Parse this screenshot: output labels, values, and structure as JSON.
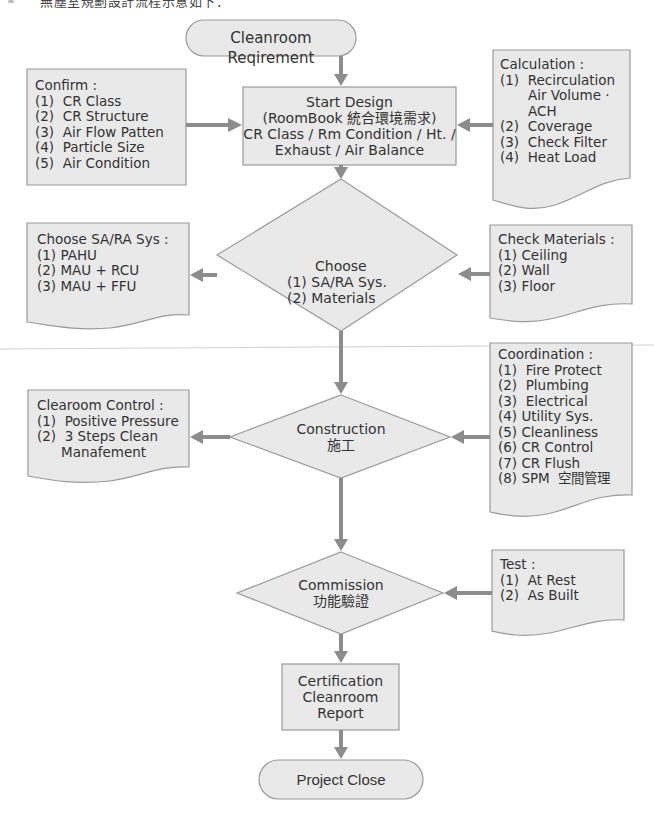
{
  "header": {
    "truncated_caption": "無塵室規劃設計流程示意如下："
  },
  "colors": {
    "shape_fill": "#e9e9e9",
    "shape_stroke": "#9a9a9a",
    "arrow": "#8c8c8c",
    "text": "#333333"
  },
  "nodes": {
    "start": {
      "label": "Cleanroom Reqirement"
    },
    "start_design": {
      "lines": [
        "Start Design",
        "(RoomBook 統合環境需求)",
        "CR Class / Rm Condition / Ht. /",
        "Exhaust / Air Balance"
      ]
    },
    "choose": {
      "lines": [
        "Choose",
        "(1) SA/RA Sys.",
        "(2) Materials"
      ]
    },
    "construction": {
      "lines": [
        "Construction",
        "施工"
      ]
    },
    "commission": {
      "lines": [
        "Commission",
        "功能驗證"
      ]
    },
    "certification": {
      "lines": [
        "Certification",
        "Cleanroom",
        "Report"
      ]
    },
    "end": {
      "label": "Project Close"
    }
  },
  "notes": {
    "confirm": {
      "title": "Confirm :",
      "items": [
        "(1)  CR Class",
        "(2)  CR Structure",
        "(3)  Air Flow Patten",
        "(4)  Particle Size",
        "(5)  Air Condition"
      ]
    },
    "calculation": {
      "title": "Calculation :",
      "items": [
        "(1)  Recirculation",
        "Air Volume ·",
        "ACH",
        "(2)  Coverage",
        "(3)  Check Filter",
        "(4)  Heat Load"
      ]
    },
    "choose_sys": {
      "title": "Choose SA/RA Sys :",
      "items": [
        "(1) PAHU",
        "(2) MAU + RCU",
        "(3) MAU + FFU"
      ]
    },
    "check_materials": {
      "title": "Check Materials :",
      "items": [
        "(1) Ceiling",
        "(2) Wall",
        "(3) Floor"
      ]
    },
    "clearoom_control": {
      "title": "Clearoom Control :",
      "items": [
        "(1)  Positive Pressure",
        "(2)  3 Steps Clean",
        "Manafement"
      ]
    },
    "coordination": {
      "title": "Coordination :",
      "items": [
        "(1)  Fire Protect",
        "(2)  Plumbing",
        "(3)  Electrical",
        "(4) Utility Sys.",
        "(5) Cleanliness",
        "(6) CR Control",
        "(7) CR Flush",
        "(8) SPM  空間管理"
      ]
    },
    "test": {
      "title": "Test :",
      "items": [
        "(1)  At Rest",
        "(2)  As Built"
      ]
    }
  }
}
